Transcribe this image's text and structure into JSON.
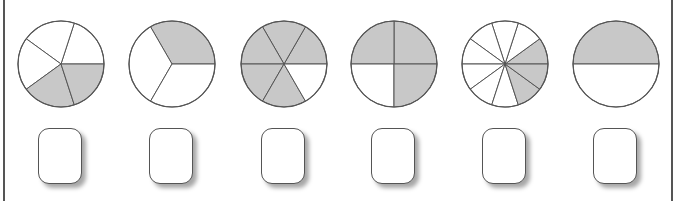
{
  "worksheet": {
    "fill_color": "#c8c8c8",
    "stroke_color": "#555555",
    "fractions": [
      {
        "id": "pie-1",
        "cx": 61,
        "parts": 5,
        "shaded": [
          3,
          4
        ],
        "answer": ""
      },
      {
        "id": "pie-2",
        "cx": 172,
        "parts": 3,
        "shaded": [
          0
        ],
        "answer": ""
      },
      {
        "id": "pie-3",
        "cx": 284,
        "parts": 6,
        "shaded": [
          0,
          1,
          2,
          3,
          4
        ],
        "answer": ""
      },
      {
        "id": "pie-4",
        "cx": 394,
        "parts": 4,
        "shaded": [
          0,
          1,
          3
        ],
        "answer": ""
      },
      {
        "id": "pie-5",
        "cx": 505,
        "parts": 10,
        "shaded": [
          0,
          8,
          9
        ],
        "answer": ""
      },
      {
        "id": "pie-6",
        "cx": 616,
        "parts": 2,
        "shaded": [
          0
        ],
        "answer": ""
      }
    ]
  }
}
